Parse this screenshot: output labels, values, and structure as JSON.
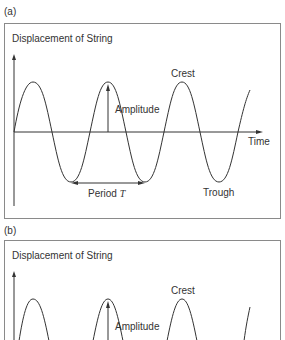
{
  "panels": [
    {
      "label": "(a)",
      "title": "Displacement of String",
      "annotations": {
        "crest": "Crest",
        "amplitude": "Amplitude",
        "time": "Time",
        "period": "Period",
        "period_symbol": "T",
        "trough": "Trough"
      }
    },
    {
      "label": "(b)",
      "title": "Displacement of String",
      "annotations": {
        "crest": "Crest",
        "amplitude": "Amplitude"
      }
    }
  ],
  "colors": {
    "frame": "#8a8a8a",
    "line": "#333333",
    "text": "#333333"
  }
}
